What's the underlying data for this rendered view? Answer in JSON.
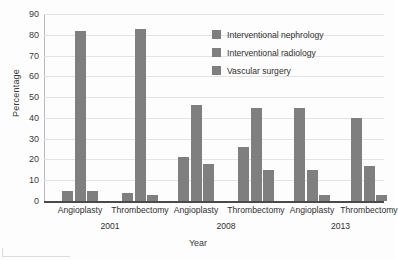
{
  "chart_data": {
    "type": "bar",
    "title": "",
    "xlabel": "Year",
    "ylabel": "Percentage",
    "ylim": [
      0,
      90
    ],
    "yticks": [
      0,
      10,
      20,
      30,
      40,
      50,
      60,
      70,
      80,
      90
    ],
    "grid": true,
    "legend_position": "top-right",
    "categories": [
      "Angioplasty",
      "Thrombectomy",
      "Angioplasty",
      "Thrombectomy",
      "Angioplasty",
      "Thrombectomy"
    ],
    "group_labels": [
      "2001",
      "2008",
      "2013"
    ],
    "series": [
      {
        "name": "Interventional nephrology",
        "color": "#7f7f7f",
        "values": [
          5,
          4,
          21,
          26,
          45,
          40
        ]
      },
      {
        "name": "Interventional radiology",
        "color": "#7f7f7f",
        "values": [
          82,
          83,
          46,
          45,
          15,
          17
        ]
      },
      {
        "name": "Vascular surgery",
        "color": "#7f7f7f",
        "values": [
          5,
          3,
          18,
          15,
          3,
          3
        ]
      }
    ]
  },
  "axes": {
    "y_title": "Percentage",
    "x_title": "Year",
    "y_tick_labels": [
      "0",
      "10",
      "20",
      "30",
      "40",
      "50",
      "60",
      "70",
      "80",
      "90"
    ]
  },
  "legend": {
    "items": [
      {
        "label": "Interventional nephrology",
        "color": "#7f7f7f"
      },
      {
        "label": "Interventional radiology",
        "color": "#7f7f7f"
      },
      {
        "label": "Vascular surgery",
        "color": "#7f7f7f"
      }
    ]
  },
  "x_axis_ticks": {
    "categories": [
      "Angioplasty",
      "Thrombectomy",
      "Angioplasty",
      "Thrombectomy",
      "Angioplasty",
      "Thrombectomy"
    ],
    "years": [
      "2001",
      "2008",
      "2013"
    ]
  }
}
